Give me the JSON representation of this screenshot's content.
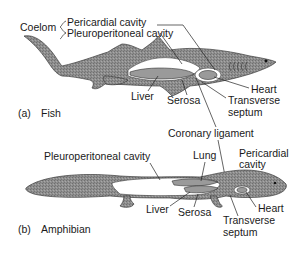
{
  "figure": {
    "panels": [
      {
        "id": "a",
        "tag": "(a)",
        "title": "Fish",
        "labels": {
          "coelom": "Coelom",
          "pericardial": "Pericardial cavity",
          "pleuroperitoneal": "Pleuroperitoneal cavity",
          "liver": "Liver",
          "serosa": "Serosa",
          "heart": "Heart",
          "transverse1": "Transverse",
          "transverse2": "septum"
        }
      },
      {
        "id": "b",
        "tag": "(b)",
        "title": "Amphibian",
        "labels": {
          "pleuroperitoneal": "Pleuroperitoneal cavity",
          "lung": "Lung",
          "pericardial1": "Pericardial",
          "pericardial2": "cavity",
          "liver": "Liver",
          "serosa": "Serosa",
          "heart": "Heart",
          "transverse1": "Transverse",
          "transverse2": "septum"
        }
      }
    ],
    "shared": {
      "coronary_ligament": "Coronary ligament"
    },
    "colors": {
      "body": "#8f8f8f",
      "organ": "#9a9a9a",
      "cavity": "#ffffff",
      "text": "#1a1a1a"
    }
  }
}
